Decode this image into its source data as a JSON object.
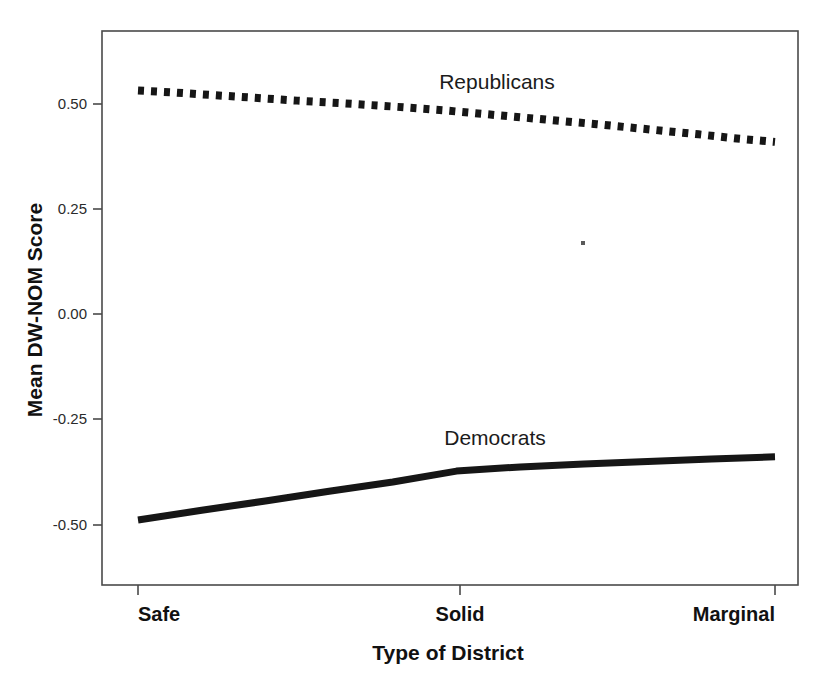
{
  "chart_data": {
    "type": "line",
    "title": "",
    "xlabel": "Type of District",
    "ylabel": "Mean DW-NOM Score",
    "categories": [
      "Safe",
      "Solid",
      "Marginal"
    ],
    "x_tick_labels": [
      "Safe",
      "Solid",
      "Marginal"
    ],
    "y_tick_labels": [
      "0.50",
      "0.25",
      "0.00",
      "-0.25",
      "-0.50"
    ],
    "y_tick_values": [
      0.5,
      0.25,
      0.0,
      -0.25,
      -0.5
    ],
    "ylim": [
      -0.64,
      0.67
    ],
    "xlim": [
      0,
      1
    ],
    "grid": false,
    "legend_position": "inline-annotation",
    "series": [
      {
        "name": "Republicans",
        "style": "dotted",
        "color": "#161616",
        "label_text": "Republicans",
        "values": [
          0.532,
          0.505,
          0.468,
          0.41
        ],
        "x": [
          0.0,
          0.33,
          0.66,
          1.0
        ],
        "points": [
          {
            "x": 0.0,
            "y": 0.532
          },
          {
            "x": 0.06,
            "y": 0.527
          },
          {
            "x": 0.12,
            "y": 0.521
          },
          {
            "x": 0.18,
            "y": 0.515
          },
          {
            "x": 0.25,
            "y": 0.508
          },
          {
            "x": 0.32,
            "y": 0.502
          },
          {
            "x": 0.4,
            "y": 0.494
          },
          {
            "x": 0.48,
            "y": 0.485
          },
          {
            "x": 0.56,
            "y": 0.474
          },
          {
            "x": 0.64,
            "y": 0.463
          },
          {
            "x": 0.72,
            "y": 0.452
          },
          {
            "x": 0.8,
            "y": 0.44
          },
          {
            "x": 0.88,
            "y": 0.428
          },
          {
            "x": 0.94,
            "y": 0.418
          },
          {
            "x": 1.0,
            "y": 0.41
          }
        ]
      },
      {
        "name": "Democrats",
        "style": "solid",
        "color": "#161616",
        "label_text": "Democrats",
        "values": [
          -0.488,
          -0.372,
          -0.338
        ],
        "x": [
          0.0,
          0.5,
          1.0
        ],
        "points": [
          {
            "x": 0.0,
            "y": -0.488
          },
          {
            "x": 0.1,
            "y": -0.465
          },
          {
            "x": 0.2,
            "y": -0.443
          },
          {
            "x": 0.3,
            "y": -0.42
          },
          {
            "x": 0.4,
            "y": -0.398
          },
          {
            "x": 0.5,
            "y": -0.372
          },
          {
            "x": 0.6,
            "y": -0.362
          },
          {
            "x": 0.7,
            "y": -0.355
          },
          {
            "x": 0.8,
            "y": -0.349
          },
          {
            "x": 0.9,
            "y": -0.343
          },
          {
            "x": 1.0,
            "y": -0.338
          }
        ]
      }
    ],
    "annotations": [
      {
        "name": "republicans-label",
        "text": "Republicans",
        "x_px": 497,
        "y_px": 89
      },
      {
        "name": "democrats-label",
        "text": "Democrats",
        "x_px": 495,
        "y_px": 445
      }
    ]
  },
  "axes": {
    "y_title": "Mean DW-NOM Score",
    "x_title": "Type of District",
    "y_ticks": [
      {
        "label": "0.50",
        "y_px": 104
      },
      {
        "label": "0.25",
        "y_px": 209
      },
      {
        "label": "0.00",
        "y_px": 314
      },
      {
        "label": "-0.25",
        "y_px": 419
      },
      {
        "label": "-0.50",
        "y_px": 525
      }
    ],
    "x_ticks": [
      {
        "label": "Safe",
        "x_px": 138,
        "anchor": "start"
      },
      {
        "label": "Solid",
        "x_px": 460,
        "anchor": "middle"
      },
      {
        "label": "Marginal",
        "x_px": 775,
        "anchor": "end"
      }
    ]
  },
  "plot_frame": {
    "left_px": 102,
    "top_px": 31,
    "right_px": 798,
    "bottom_px": 585
  },
  "artifact": {
    "name": "scan-speck",
    "x_px": 583,
    "y_px": 243
  }
}
